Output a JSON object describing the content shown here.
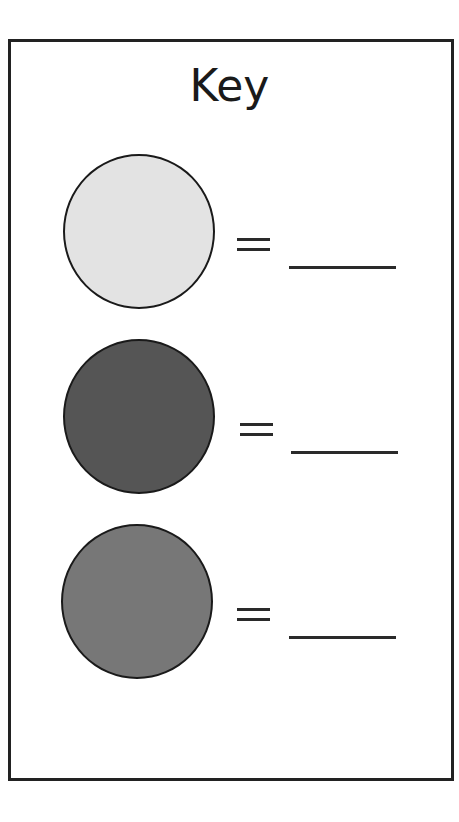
{
  "key": {
    "title": "Key",
    "border_color": "#222222",
    "entries": [
      {
        "swatch_shape": "circle",
        "swatch_color": "#e3e3e3",
        "swatch_label": "light-gray",
        "equals_symbol": "=",
        "value": ""
      },
      {
        "swatch_shape": "circle",
        "swatch_color": "#555555",
        "swatch_label": "dark-gray",
        "equals_symbol": "=",
        "value": ""
      },
      {
        "swatch_shape": "circle",
        "swatch_color": "#777777",
        "swatch_label": "medium-gray",
        "equals_symbol": "=",
        "value": ""
      }
    ]
  }
}
